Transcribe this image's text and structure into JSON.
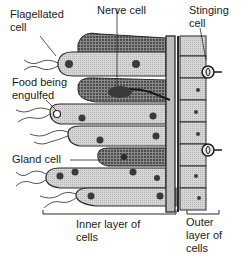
{
  "diagram": {
    "type": "biology-cell-layers",
    "labels": {
      "flagellated_cell": [
        "Flagellated",
        "cell"
      ],
      "nerve_cell": "Nerve cell",
      "stinging_cell": [
        "Stinging",
        "cell"
      ],
      "food_engulfed": [
        "Food being",
        "engulfed"
      ],
      "gland_cell": "Gland cell",
      "inner_layer": [
        "Inner layer of",
        "cells"
      ],
      "outer_layer": [
        "Outer",
        "layer of",
        "cells"
      ]
    },
    "colors": {
      "cell_fill": "#d4d4d4",
      "gland_fill": "#9a9a9a",
      "outline": "#2a2a2a",
      "mesoglea": "#bdbdbd",
      "background": "#ffffff"
    }
  }
}
